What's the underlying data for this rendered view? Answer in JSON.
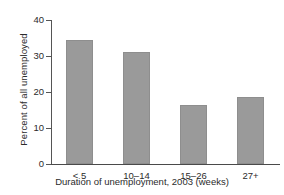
{
  "chart_data": {
    "type": "bar",
    "title": "",
    "subtitle": "",
    "xlabel": "Duration of unemployment, 2003 (weeks)",
    "ylabel": "Percent of all unemployed",
    "categories": [
      "< 5",
      "10–14",
      "15–26",
      "27+"
    ],
    "values": [
      34.5,
      31.0,
      16.5,
      18.5
    ],
    "series": [
      {
        "name": "Percent of all unemployed",
        "values": [
          34.5,
          31.0,
          16.5,
          18.5
        ]
      }
    ],
    "ylim": [
      0,
      40
    ],
    "ytick_labels": [
      "0",
      "10",
      "20",
      "30",
      "40"
    ],
    "ytick_values": [
      0,
      10,
      20,
      30,
      40
    ],
    "grid": false,
    "legend": false,
    "legend_position": "none",
    "bar_color": "#9a9a9a",
    "bar_edge_color": "#8e8e8e",
    "axis_color": "#4a4a4a",
    "text_color": "#2b2b2b",
    "background_color": "#ffffff",
    "annotations": []
  }
}
